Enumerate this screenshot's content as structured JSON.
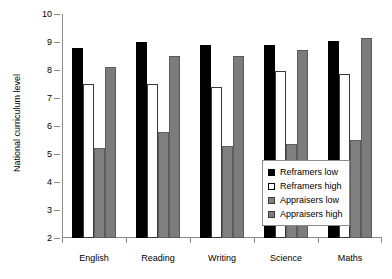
{
  "chart_data": {
    "type": "bar",
    "title": "",
    "xlabel": "",
    "ylabel": "National curriculum level",
    "ylim": [
      2,
      10
    ],
    "yticks": [
      2,
      3,
      4,
      5,
      6,
      7,
      8,
      9,
      10
    ],
    "grid": false,
    "legend_position": "bottom-right",
    "categories": [
      "English",
      "Reading",
      "Writing",
      "Science",
      "Maths"
    ],
    "series": [
      {
        "name": "Reframers low",
        "color": "#000000",
        "values": [
          8.8,
          9.0,
          8.9,
          8.9,
          9.05
        ]
      },
      {
        "name": "Reframers high",
        "color": "#ffffff",
        "values": [
          7.5,
          7.5,
          7.4,
          7.95,
          7.85
        ]
      },
      {
        "name": "Appraisers low",
        "color": "#808080",
        "values": [
          5.2,
          5.8,
          5.3,
          5.35,
          5.5
        ]
      },
      {
        "name": "Appraisers high",
        "color": "#7c7c7c",
        "values": [
          8.1,
          8.5,
          8.5,
          8.7,
          9.15
        ]
      }
    ]
  }
}
